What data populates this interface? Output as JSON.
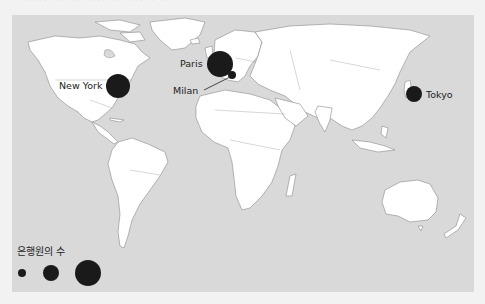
{
  "header": {
    "cropped_caption": "······ ··· ···· ····· ·· ···· ·· ···"
  },
  "map": {
    "background_color": "#d9d9d9",
    "land_color": "#ffffff",
    "bubble_color": "#1a1a1a"
  },
  "cities": [
    {
      "name": "New York",
      "size": "large"
    },
    {
      "name": "Paris",
      "size": "large"
    },
    {
      "name": "Milan",
      "size": "small"
    },
    {
      "name": "Tokyo",
      "size": "medium"
    }
  ],
  "legend": {
    "title": "은행원의 수",
    "sizes": [
      "small",
      "medium",
      "large"
    ]
  }
}
